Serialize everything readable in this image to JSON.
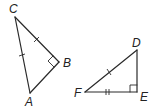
{
  "diagram": {
    "type": "geometry",
    "triangles": [
      {
        "name": "triangle-ABC",
        "vertices": {
          "C": {
            "label": "C",
            "x": 15,
            "y": 17
          },
          "B": {
            "label": "B",
            "x": 59,
            "y": 62
          },
          "A": {
            "label": "A",
            "x": 30,
            "y": 93
          }
        },
        "right_angle_at": "B",
        "marks": {
          "CB": 1,
          "CA": 1
        }
      },
      {
        "name": "triangle-DEF",
        "vertices": {
          "D": {
            "label": "D",
            "x": 137,
            "y": 50
          },
          "E": {
            "label": "E",
            "x": 137,
            "y": 92
          },
          "F": {
            "label": "F",
            "x": 85,
            "y": 92
          }
        },
        "right_angle_at": "E",
        "marks": {
          "FD": 1,
          "FE": 2
        }
      }
    ],
    "labels": {
      "C": "C",
      "B": "B",
      "A": "A",
      "D": "D",
      "E": "E",
      "F": "F"
    },
    "colors": {
      "stroke": "#2a2a2a",
      "background": "#ffffff"
    }
  }
}
